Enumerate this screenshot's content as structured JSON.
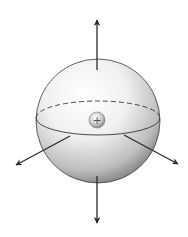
{
  "diagram": {
    "sphere": {
      "cx": 98,
      "cy": 121,
      "r": 62,
      "fill_light": "#f7f7f7",
      "fill_dark": "#8a8a8a",
      "stroke": "#3a3a3a"
    },
    "equator": {
      "cy": 118,
      "rx": 62,
      "ry": 17,
      "front_style": "solid",
      "back_style": "dashed"
    },
    "charge": {
      "cx": 97,
      "cy": 120,
      "r": 8,
      "symbol": "+",
      "label": "positive charge"
    },
    "arrows": [
      {
        "name": "up",
        "x1": 97,
        "y1": 70,
        "x2": 97,
        "y2": 20
      },
      {
        "name": "down",
        "x1": 97,
        "y1": 176,
        "x2": 97,
        "y2": 223
      },
      {
        "name": "left",
        "x1": 70,
        "y1": 136,
        "x2": 16,
        "y2": 165
      },
      {
        "name": "right",
        "x1": 124,
        "y1": 135,
        "x2": 178,
        "y2": 164
      }
    ],
    "arrow_color": "#2a2a2a"
  }
}
